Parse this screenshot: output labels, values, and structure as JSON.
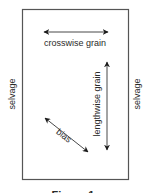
{
  "figure": {
    "caption": "Figure 1",
    "labels": {
      "crosswise": "crosswise grain",
      "lengthwise": "lengthwise grain",
      "bias": "bias",
      "selvage_left": "selvage",
      "selvage_right": "selvage"
    },
    "colors": {
      "border": "#555555",
      "arrow": "#1a1a1a",
      "text": "#2a2a2a"
    }
  }
}
